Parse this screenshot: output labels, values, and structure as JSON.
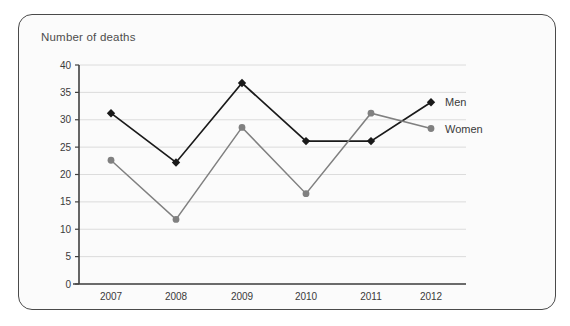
{
  "chart_data": {
    "type": "line",
    "title": "Number of deaths",
    "xlabel": "",
    "ylabel": "",
    "categories": [
      "2007",
      "2008",
      "2009",
      "2010",
      "2011",
      "2012"
    ],
    "series": [
      {
        "name": "Men",
        "values": [
          31.2,
          22.2,
          36.7,
          26.1,
          26.1,
          33.2
        ],
        "color": "#1a1a1a",
        "marker": "diamond"
      },
      {
        "name": "Women",
        "values": [
          22.6,
          11.8,
          28.6,
          16.5,
          31.2,
          28.4
        ],
        "color": "#808080",
        "marker": "circle"
      }
    ],
    "ylim": [
      0,
      40
    ],
    "yticks": [
      0,
      5,
      10,
      15,
      20,
      25,
      30,
      35,
      40
    ],
    "ytick_labels": [
      "0",
      "5",
      "10",
      "15",
      "20",
      "25",
      "30",
      "35",
      "40"
    ],
    "grid": true,
    "legend_position": "right"
  },
  "colors": {
    "men": "#1a1a1a",
    "women": "#808080",
    "grid": "#d8d8d8",
    "axis": "#404040",
    "card_border": "#4a4a4a",
    "card_background": "#fbfbfb",
    "title_text": "#4d4d4d"
  }
}
